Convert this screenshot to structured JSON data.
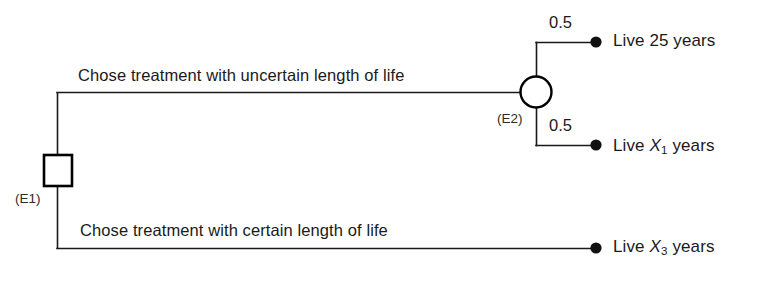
{
  "diagram": {
    "type": "decision-tree",
    "nodes": [
      {
        "id": "E1",
        "kind": "decision",
        "shape": "square",
        "label": "(E1)"
      },
      {
        "id": "E2",
        "kind": "chance",
        "shape": "circle",
        "label": "(E2)"
      }
    ],
    "branch_labels": {
      "upper": "Chose treatment with uncertain length of life",
      "lower": "Chose treatment with certain length of life"
    },
    "probabilities": {
      "upper": "0.5",
      "lower": "0.5"
    },
    "outcomes": {
      "upper": {
        "prefix": "Live 25 years"
      },
      "middle": {
        "prefix": "Live ",
        "variable": "X",
        "subscript": "1",
        "suffix": " years"
      },
      "lower": {
        "prefix": "Live ",
        "variable": "X",
        "subscript": "3",
        "suffix": " years"
      }
    },
    "colors": {
      "line": "#1a1a1a",
      "node_stroke": "#000000",
      "terminal_dot": "#111111",
      "background": "#ffffff",
      "text": "#1a1a1a"
    }
  }
}
